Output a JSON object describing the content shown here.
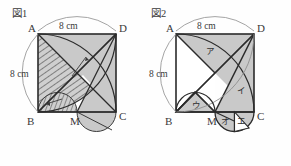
{
  "figures": [
    {
      "title": "図1",
      "square": {
        "vertices": [
          {
            "name": "A",
            "label": "A",
            "pos": "top-left"
          },
          {
            "name": "D",
            "label": "D",
            "pos": "top-right"
          },
          {
            "name": "B",
            "label": "B",
            "pos": "bottom-left"
          },
          {
            "name": "C",
            "label": "C",
            "pos": "bottom-right"
          }
        ],
        "midpoint": {
          "name": "M",
          "label": "M",
          "pos": "bottom-middle"
        }
      },
      "dimensions": [
        {
          "label": "8 cm",
          "side": "top",
          "value": 8,
          "unit": "cm"
        },
        {
          "label": "8 cm",
          "side": "left",
          "value": 8,
          "unit": "cm"
        }
      ],
      "shading": [
        "gray-fill",
        "diagonal-hatch"
      ],
      "notes": [
        "leader-arrow-upper",
        "leader-arrow-lower"
      ]
    },
    {
      "title": "図2",
      "square": {
        "vertices": [
          {
            "name": "A",
            "label": "A",
            "pos": "top-left"
          },
          {
            "name": "D",
            "label": "D",
            "pos": "top-right"
          },
          {
            "name": "B",
            "label": "B",
            "pos": "bottom-left"
          },
          {
            "name": "C",
            "label": "C",
            "pos": "bottom-right"
          }
        ],
        "midpoint": {
          "name": "M",
          "label": "M",
          "pos": "bottom-middle"
        }
      },
      "dimensions": [
        {
          "label": "8 cm",
          "side": "top",
          "value": 8,
          "unit": "cm"
        },
        {
          "label": "8 cm",
          "side": "left",
          "value": 8,
          "unit": "cm"
        }
      ],
      "region_labels": [
        {
          "key": "a",
          "label": "ア"
        },
        {
          "key": "i",
          "label": "イ"
        },
        {
          "key": "u",
          "label": "ウ"
        },
        {
          "key": "e",
          "label": "エ"
        },
        {
          "key": "o",
          "label": "オ"
        }
      ],
      "shading": [
        "gray-fill"
      ]
    }
  ],
  "colors": {
    "background": "#fefefe",
    "stroke": "#2b2b2b",
    "stroke_light": "#8a8a8a",
    "fill_gray": "#c8c8c8",
    "fill_white": "#ffffff",
    "text": "#3a3a3a"
  }
}
